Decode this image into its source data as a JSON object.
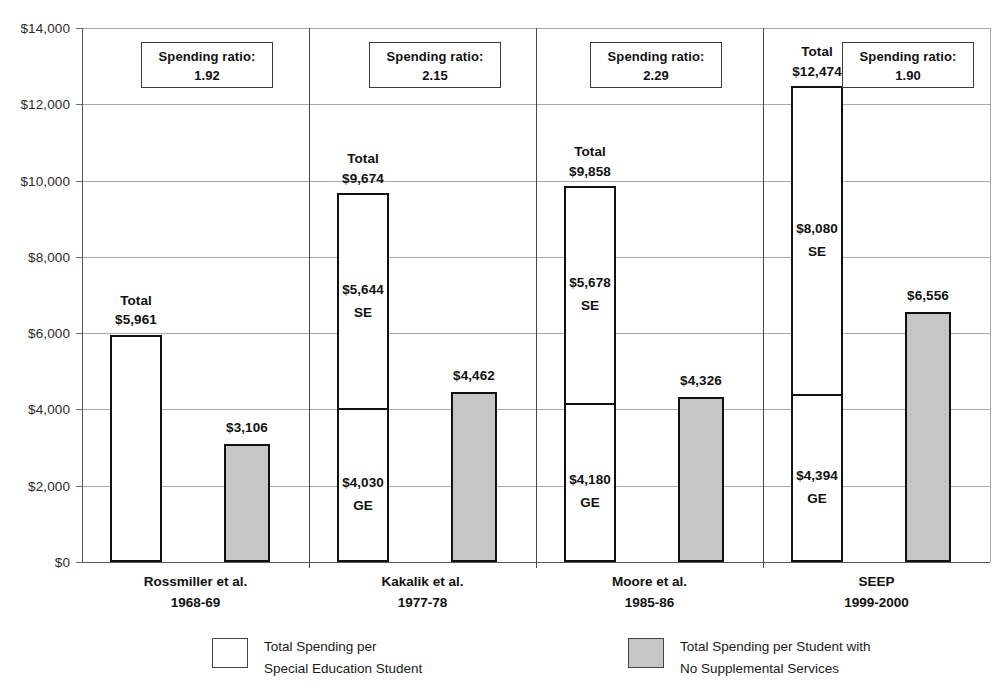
{
  "chart_data": {
    "type": "bar",
    "title": "",
    "subtitle": "",
    "xlabel": "",
    "ylabel": "",
    "ylim": [
      0,
      14000
    ],
    "ytick_step": 2000,
    "grid": true,
    "legend_position": "bottom",
    "stacked_series_note": "White bar is stacked (GE bottom + SE top) for groups 2-4; group 1 white bar is a single total.",
    "y_ticks": [
      "$0",
      "$2,000",
      "$4,000",
      "$6,000",
      "$8,000",
      "$10,000",
      "$12,000",
      "$14,000"
    ],
    "y_tick_values": [
      0,
      2000,
      4000,
      6000,
      8000,
      10000,
      12000,
      14000
    ],
    "categories": [
      "Rossmiller et al.",
      "Kakalik et al.",
      "Moore et al.",
      "SEEP"
    ],
    "category_years": [
      "1968-69",
      "1977-78",
      "1985-86",
      "1999-2000"
    ],
    "series": [
      {
        "name": "Total Spending per Special Education Student",
        "fill": "#ffffff",
        "values": [
          5961,
          9674,
          9858,
          12474
        ]
      },
      {
        "name": "Total Spending per Student with No Supplemental Services",
        "fill": "#c6c6c6",
        "values": [
          3106,
          4462,
          4326,
          6556
        ]
      }
    ],
    "groups": [
      {
        "label": "Rossmiller et al.",
        "year": "1968-69",
        "total": 5961,
        "total_caption": "Total",
        "total_label": "$5,961",
        "ge": null,
        "ge_label": "",
        "se": null,
        "se_label": "",
        "ge_tag": "",
        "se_tag": "",
        "comparison": 3106,
        "comparison_label": "$3,106",
        "ratio_caption": "Spending ratio:",
        "ratio": "1.92"
      },
      {
        "label": "Kakalik et al.",
        "year": "1977-78",
        "total": 9674,
        "total_caption": "Total",
        "total_label": "$9,674",
        "ge": 4030,
        "ge_label": "$4,030",
        "ge_tag": "GE",
        "se": 5644,
        "se_label": "$5,644",
        "se_tag": "SE",
        "comparison": 4462,
        "comparison_label": "$4,462",
        "ratio_caption": "Spending ratio:",
        "ratio": "2.15"
      },
      {
        "label": "Moore et al.",
        "year": "1985-86",
        "total": 9858,
        "total_caption": "Total",
        "total_label": "$9,858",
        "ge": 4180,
        "ge_label": "$4,180",
        "ge_tag": "GE",
        "se": 5678,
        "se_label": "$5,678",
        "se_tag": "SE",
        "comparison": 4326,
        "comparison_label": "$4,326",
        "ratio_caption": "Spending ratio:",
        "ratio": "2.29"
      },
      {
        "label": "SEEP",
        "year": "1999-2000",
        "total": 12474,
        "total_caption": "Total",
        "total_label": "$12,474",
        "ge": 4394,
        "ge_label": "$4,394",
        "ge_tag": "GE",
        "se": 8080,
        "se_label": "$8,080",
        "se_tag": "SE",
        "comparison": 6556,
        "comparison_label": "$6,556",
        "ratio_caption": "Spending ratio:",
        "ratio": "1.90"
      }
    ],
    "legend": [
      {
        "swatch": "white",
        "line1": "Total Spending per",
        "line2": "Special Education Student"
      },
      {
        "swatch": "gray",
        "line1": "Total Spending per Student with",
        "line2": "No Supplemental Services"
      }
    ]
  },
  "axis": {
    "tick_0": "$0",
    "tick_2000": "$2,000",
    "tick_4000": "$4,000",
    "tick_6000": "$6,000",
    "tick_8000": "$8,000",
    "tick_10000": "$10,000",
    "tick_12000": "$12,000",
    "tick_14000": "$14,000"
  },
  "colors": {
    "bar_white": "#ffffff",
    "bar_gray": "#c6c6c6",
    "bar_outline": "#111111",
    "gridline": "#a9a9a9",
    "axis": "#565656",
    "text": "#111111"
  }
}
